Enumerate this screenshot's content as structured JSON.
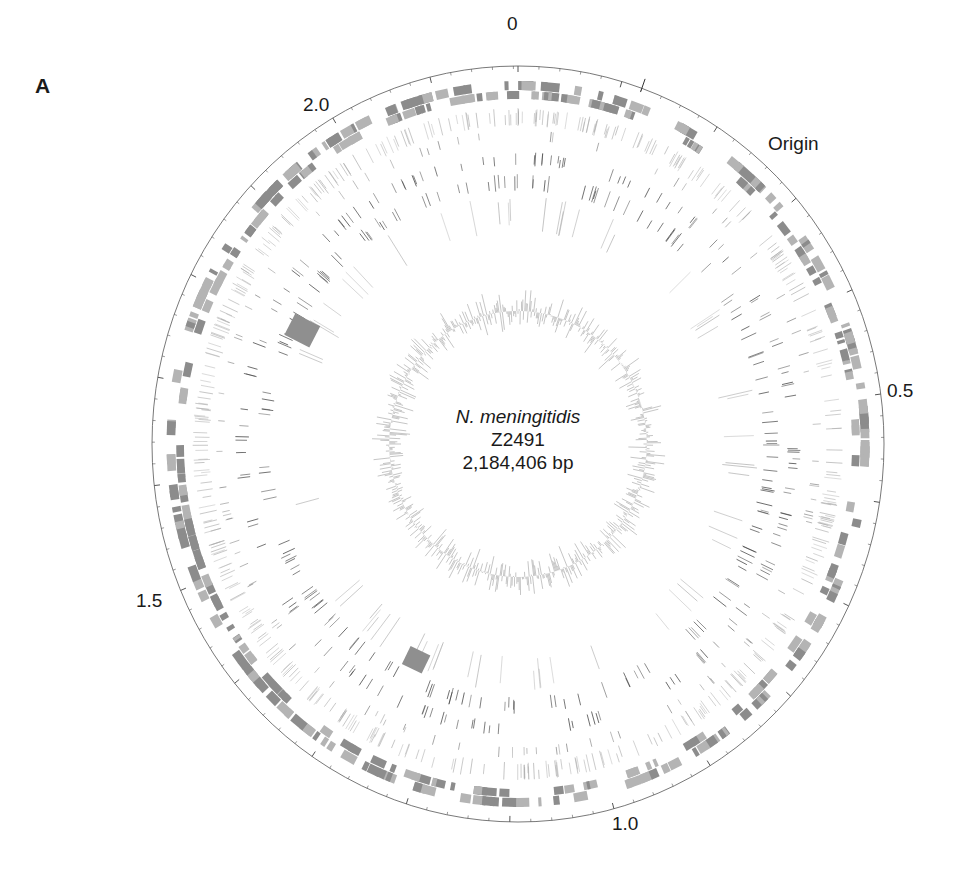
{
  "figure": {
    "panel_label": "A",
    "title_lines": {
      "organism": "N. meningitidis",
      "strain": "Z2491",
      "genome_size": "2,184,406 bp"
    },
    "scale_labels": [
      {
        "text": "0",
        "position_mb": 0.0
      },
      {
        "text": "0.5",
        "position_mb": 0.5
      },
      {
        "text": "1.0",
        "position_mb": 1.0
      },
      {
        "text": "1.5",
        "position_mb": 1.5
      },
      {
        "text": "2.0",
        "position_mb": 2.0
      }
    ],
    "origin_label": "Origin",
    "genome_length_bp": 2184406,
    "origin_position_mb": 0.12
  },
  "layout": {
    "center_x": 518,
    "center_y": 444,
    "outer_radius_x": 366,
    "outer_radius_y": 378,
    "colors": {
      "axis": "#555555",
      "gene_dark": "#8c8c8c",
      "gene_light": "#b4b4b4",
      "feature_dark": "#2a2a2a",
      "feature_mid": "#777777",
      "feature_light": "#aaaaaa",
      "island_block": "#8f8f8f",
      "gc_skew": "#9a9a9a"
    }
  },
  "tracks": [
    {
      "name": "forward-strand-genes",
      "r_inner": 354,
      "r_outer": 363,
      "count": 180,
      "style": "block",
      "color": "gene_dark"
    },
    {
      "name": "reverse-strand-genes",
      "r_inner": 345,
      "r_outer": 353,
      "count": 170,
      "style": "block",
      "color": "gene_light"
    },
    {
      "name": "repeat-track-1",
      "r_inner": 318,
      "r_outer": 336,
      "count": 420,
      "style": "line",
      "color": "feature_light"
    },
    {
      "name": "repeat-track-2",
      "r_inner": 303,
      "r_outer": 314,
      "count": 90,
      "style": "line",
      "color": "feature_mid"
    },
    {
      "name": "repeat-track-3",
      "r_inner": 278,
      "r_outer": 292,
      "count": 140,
      "style": "line",
      "color": "feature_dark"
    },
    {
      "name": "repeat-track-4",
      "r_inner": 253,
      "r_outer": 270,
      "count": 160,
      "style": "line",
      "color": "feature_dark"
    },
    {
      "name": "repeat-track-5",
      "r_inner": 212,
      "r_outer": 248,
      "count": 60,
      "style": "line",
      "color": "feature_light"
    }
  ],
  "island_blocks": [
    {
      "name": "island-block-1",
      "angle_deg": 297,
      "r": 250,
      "w": 24,
      "h": 28
    },
    {
      "name": "island-block-2",
      "angle_deg": 206,
      "r": 240,
      "w": 22,
      "h": 20
    }
  ],
  "gc_skew": {
    "radius": 133,
    "amplitude": 24,
    "count": 720
  }
}
